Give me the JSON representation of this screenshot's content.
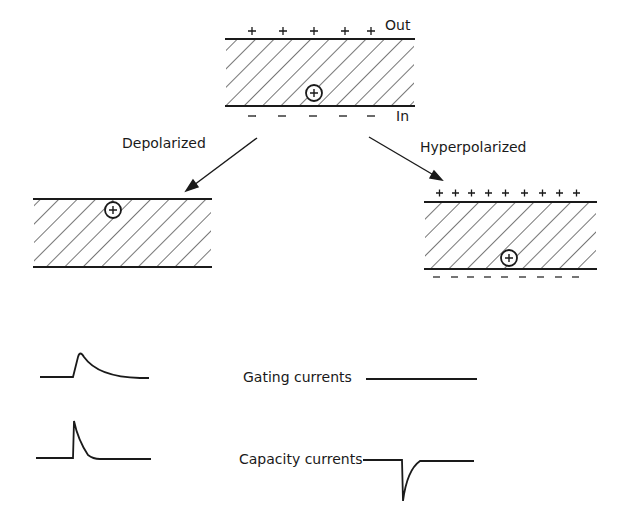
{
  "diagram": {
    "top_membrane": {
      "outside_label": "Out",
      "inside_label": "In",
      "outside_charge": "+",
      "inside_charge": "−",
      "ion": "+"
    },
    "transitions": [
      {
        "label": "Depolarized"
      },
      {
        "label": "Hyperpolarized"
      }
    ],
    "left_membrane": {
      "state": "Depolarized",
      "ion": "+"
    },
    "right_membrane": {
      "state": "Hyperpolarized",
      "outside_charge": "+",
      "inside_charge": "−",
      "ion": "+"
    },
    "traces": {
      "row1_label": "Gating currents",
      "row2_label": "Capacity currents"
    }
  },
  "colors": {
    "ink": "#1a1a1a",
    "background": "#ffffff"
  }
}
